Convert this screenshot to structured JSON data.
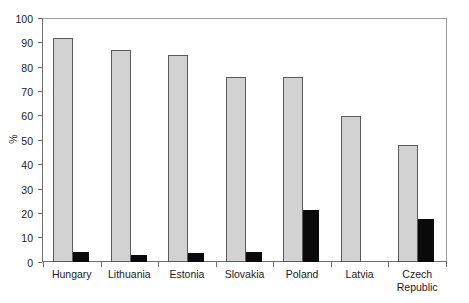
{
  "chart_data": {
    "type": "bar",
    "title": "",
    "subtitle": "",
    "xlabel": "",
    "ylabel": "%",
    "ylim": [
      0,
      100
    ],
    "ytick_step": 10,
    "yticks": [
      100,
      90,
      80,
      70,
      60,
      50,
      40,
      30,
      20,
      10,
      0
    ],
    "ytick_labels": [
      "100",
      "90",
      "80",
      "70",
      "60",
      "50",
      "40",
      "30",
      "20",
      "10",
      "0"
    ],
    "grid": false,
    "legend": "none",
    "categories": [
      "Hungary",
      "Lithuania",
      "Estonia",
      "Slovakia",
      "Poland",
      "Latvia",
      "Czech Republic"
    ],
    "category_lines": [
      [
        "Hungary"
      ],
      [
        "Lithuania"
      ],
      [
        "Estonia"
      ],
      [
        "Slovakia"
      ],
      [
        "Poland"
      ],
      [
        "Latvia"
      ],
      [
        "Czech",
        "Republic"
      ]
    ],
    "series": [
      {
        "name": "series-light",
        "color": "#d2d2d2",
        "values": [
          92,
          87,
          85,
          76,
          76,
          60,
          48
        ]
      },
      {
        "name": "series-dark",
        "color": "#0a0a0a",
        "values": [
          4,
          3,
          3.5,
          4,
          21.5,
          0,
          17.5
        ]
      }
    ]
  },
  "colors": {
    "light_bar": "#d2d2d2",
    "dark_bar": "#0a0a0a",
    "bar_outline": "#5a5a5a",
    "axis": "#6f6f6f",
    "frame": "#9a9a9a",
    "text": "#1a1a1a",
    "background": "#ffffff"
  }
}
